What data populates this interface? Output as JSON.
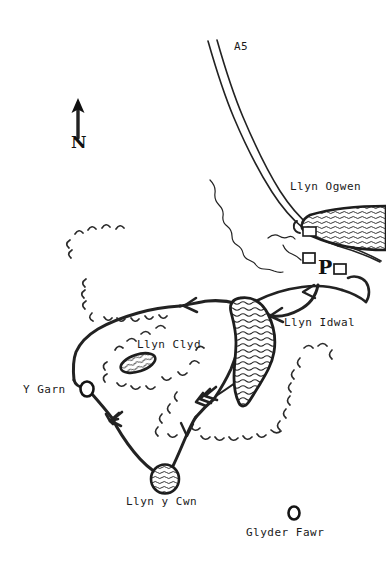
{
  "map": {
    "title": "Llyn Idwal and Glyderau walking route sketch map",
    "background_color": "#ffffff",
    "ink_color": "#222222",
    "width": 386,
    "height": 568
  },
  "compass": {
    "label": "N",
    "icon": "north-arrow-icon",
    "x": 78,
    "y": 104
  },
  "roads": [
    {
      "name": "A5",
      "label": "A5",
      "type": "road",
      "label_x": 234,
      "label_y": 50
    }
  ],
  "lakes": [
    {
      "name": "Llyn Ogwen",
      "label": "Llyn Ogwen",
      "label_x": 290,
      "label_y": 190,
      "fill": "water-hatch",
      "shape": "elongated-east"
    },
    {
      "name": "Llyn Idwal",
      "label": "Llyn Idwal",
      "label_x": 284,
      "label_y": 326,
      "fill": "water-hatch",
      "shape": "pear"
    },
    {
      "name": "Llyn Clyd",
      "label": "Llyn Clyd",
      "label_x": 137,
      "label_y": 348,
      "fill": "water-hatch",
      "shape": "small-ellipse"
    },
    {
      "name": "Llyn y Cwn",
      "label": "Llyn y Cwn",
      "label_x": 126,
      "label_y": 505,
      "fill": "water-hatch",
      "shape": "small-round"
    }
  ],
  "summits": [
    {
      "name": "Y Garn",
      "label": "Y Garn",
      "label_x": 23,
      "label_y": 392,
      "marker": "summit-circle",
      "marker_x": 87,
      "marker_y": 389
    },
    {
      "name": "Glyder Fawr",
      "label": "Glyder Fawr",
      "label_x": 246,
      "label_y": 535,
      "marker": "summit-circle",
      "marker_x": 294,
      "marker_y": 513
    }
  ],
  "facilities": [
    {
      "name": "car-park",
      "label": "P",
      "label_x": 320,
      "label_y": 272,
      "buildings": 2
    }
  ],
  "features": {
    "crags_symbol": "crag-arc-marks",
    "route_symbol": "direction-chevron",
    "stream_symbol": "wiggly-stream-line"
  }
}
